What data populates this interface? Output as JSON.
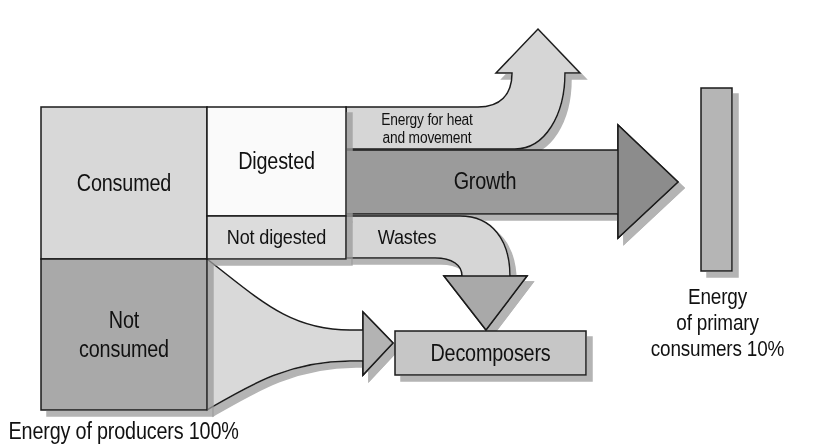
{
  "diagram": {
    "type": "energy-flow",
    "colors": {
      "consumed": "#d8d8d8",
      "digested": "#fafafa",
      "not_digested": "#dcdcdc",
      "not_consumed": "#a9a9a9",
      "growth": "#9b9b9b",
      "heat_arrow": "#d6d6d6",
      "wastes_arrow": "#d6d6d6",
      "decomposers": "#c6c6c6",
      "primary_consumers_bar": "#b5b5b5",
      "shadow": "#b0b0b0",
      "outline": "#1a1a1a"
    },
    "boxes": {
      "consumed": "Consumed",
      "digested": "Digested",
      "not_digested": "Not digested",
      "not_consumed_line1": "Not",
      "not_consumed_line2": "consumed",
      "decomposers": "Decomposers"
    },
    "arrows": {
      "heat_line1": "Energy for heat",
      "heat_line2": "and movement",
      "growth": "Growth",
      "wastes": "Wastes"
    },
    "captions": {
      "producers": "Energy of producers 100%",
      "consumers_line1": "Energy",
      "consumers_line2": "of primary",
      "consumers_line3": "consumers 10%"
    }
  }
}
